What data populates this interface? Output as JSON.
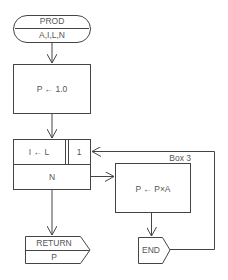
{
  "diagram": {
    "type": "flowchart",
    "colors": {
      "stroke": "#444444",
      "text": "#555555",
      "background": "#ffffff"
    },
    "start": {
      "name": "PROD",
      "params": "A,I,L,N"
    },
    "init": {
      "text": "P ← 1.0"
    },
    "loop": {
      "init": "I ← L",
      "step": "1",
      "limit": "N"
    },
    "body": {
      "label": "Box 3",
      "text": "P ← P×A"
    },
    "end": {
      "text": "END"
    },
    "return": {
      "label": "RETURN",
      "value": "P"
    }
  }
}
